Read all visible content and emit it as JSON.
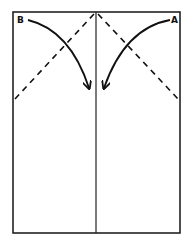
{
  "diagram": {
    "type": "paper-folding-instruction",
    "labels": {
      "corner_left": "B",
      "corner_right": "A"
    },
    "elements": {
      "sheet": "rectangular paper outline",
      "center_crease": "vertical solid line down the middle",
      "fold_lines": [
        "dashed diagonal from top center to left edge",
        "dashed diagonal from top center to right edge"
      ],
      "arrows": [
        "curved arrow from corner B toward center",
        "curved arrow from corner A toward center"
      ]
    },
    "colors": {
      "stroke": "#111111",
      "background": "#ffffff"
    }
  }
}
